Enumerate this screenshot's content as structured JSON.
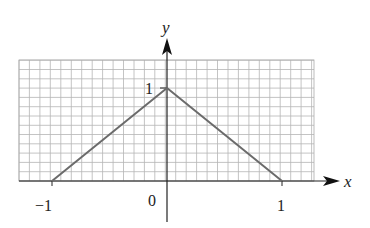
{
  "chart_data": {
    "type": "line",
    "title": "",
    "xlabel": "x",
    "ylabel": "y",
    "xlim": [
      -1.3,
      1.3
    ],
    "ylim": [
      0,
      1.4
    ],
    "grid": true,
    "x_ticks": [
      {
        "value": -1,
        "label": "−1"
      },
      {
        "value": 0,
        "label": "0"
      },
      {
        "value": 1,
        "label": "1"
      }
    ],
    "y_ticks": [
      {
        "value": 1,
        "label": "1"
      }
    ],
    "series": [
      {
        "name": "triangle",
        "x": [
          -1,
          0,
          1
        ],
        "y": [
          0,
          1,
          0
        ],
        "color": "#6b6b6b"
      }
    ],
    "legend": null
  },
  "labels": {
    "x_axis": "x",
    "y_axis": "y",
    "origin": "0",
    "x_neg_one": "−1",
    "x_one": "1",
    "y_one": "1"
  }
}
